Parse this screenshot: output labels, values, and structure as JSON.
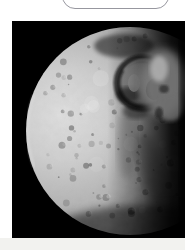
{
  "page": {
    "background": "#ffffff",
    "footer_strip_color": "#f2f2ef"
  },
  "top_widget": {
    "shape": "rounded-rectangle-bottom-fragment",
    "fill": "#ffffff",
    "border_color": "#97979f"
  },
  "photo": {
    "subject": "heavily-cratered-moon-against-black-space",
    "space_color": "#000000",
    "moon_bright_color": "#dedede",
    "moon_mid_color": "#9a9a9a",
    "moon_dark_color": "#111111",
    "crater_interior_color": "#8f8f8f",
    "crater_rim_color": "#101010",
    "lighting": "sunlit-from-left-terminator-on-right",
    "feature": "large-crater-with-central-peak-upper-right"
  }
}
